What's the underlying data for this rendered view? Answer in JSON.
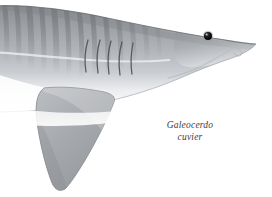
{
  "figure": {
    "background_color": "#ffffff",
    "width": 272,
    "height": 197,
    "style": "grayscale scientific line-and-wash illustration"
  },
  "label": {
    "genus": "Galeocerdo",
    "species": "cuvier",
    "full_name": "Galeocerdo cuvier",
    "font_style": "italic",
    "text_color": "#3b3b3b",
    "alignment": "center"
  },
  "palette": {
    "background": "#ffffff",
    "dorsal_dark": "#8e9195",
    "dorsal_mid": "#a6a9ad",
    "flank_light": "#c3c6c9",
    "belly_white": "#fbfbfb",
    "stripe_gray": "#7e8185",
    "outline": "#6f7276",
    "eye_black": "#1a1a1a",
    "fin_gray": "#a9acb0",
    "gill_line": "#55585c",
    "label_text": "#3b3b3b"
  },
  "anatomy": {
    "parts": [
      {
        "name": "body",
        "label": "Body (trunk)",
        "description": "Fusiform grey body occupying upper-left two thirds, darker dorsally"
      },
      {
        "name": "snout",
        "label": "Snout",
        "description": "Blunt rounded snout at right edge"
      },
      {
        "name": "eye",
        "label": "Eye",
        "description": "Small round black eye",
        "cx": 208,
        "cy": 36,
        "r": 4.2
      },
      {
        "name": "mouth",
        "label": "Mouth",
        "description": "Curved ventral mouth line below snout"
      },
      {
        "name": "nostril",
        "label": "Nostril",
        "description": "Small curved nasal flap near snout tip"
      },
      {
        "name": "gill-slits",
        "label": "Gill slits",
        "count": 5,
        "description": "Five curved vertical gill slits on the flank"
      },
      {
        "name": "pectoral-fin",
        "label": "Pectoral fin",
        "description": "Large falcate pectoral fin angled down and left"
      },
      {
        "name": "belly",
        "label": "Ventral surface",
        "description": "Pale white countershaded underside"
      },
      {
        "name": "stripes",
        "label": "Tiger stripes",
        "count": 13,
        "description": "Vertical darker grey bars along dorsal flank"
      }
    ],
    "gill_slit_positions": [
      {
        "index": 1,
        "x": 88
      },
      {
        "index": 2,
        "x": 100
      },
      {
        "index": 3,
        "x": 111
      },
      {
        "index": 4,
        "x": 122
      },
      {
        "index": 5,
        "x": 133
      }
    ],
    "stripe_positions": [
      2,
      14,
      26,
      38,
      50,
      62,
      74,
      86,
      98,
      110,
      122,
      134,
      146
    ]
  }
}
